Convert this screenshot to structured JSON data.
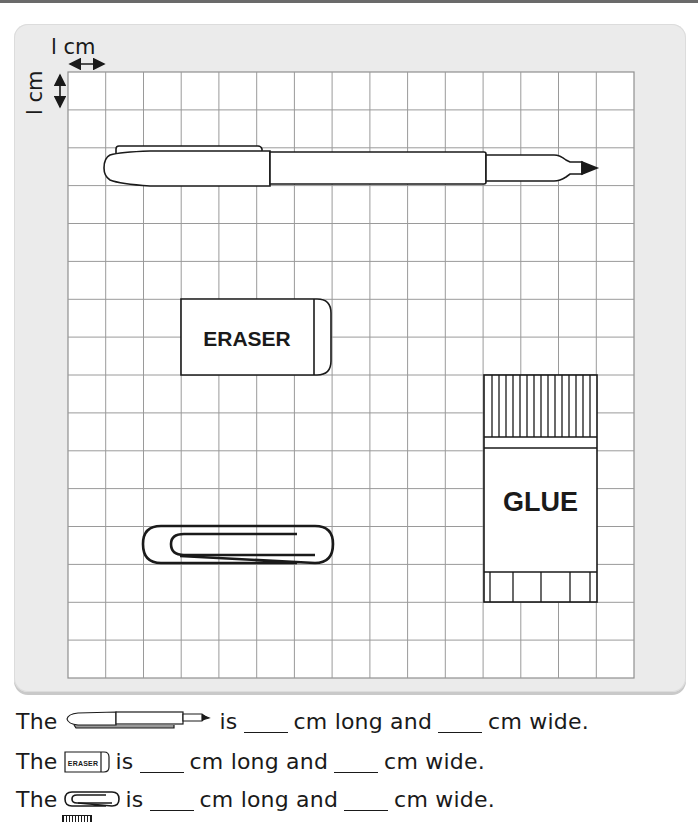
{
  "worksheet": {
    "scale_labels": {
      "horizontal": "l cm",
      "vertical": "l cm"
    },
    "grid": {
      "columns": 15,
      "rows": 16,
      "cell_size_cm": 1,
      "line_color": "#9a9a9a"
    },
    "objects": [
      {
        "name": "pen",
        "label": ""
      },
      {
        "name": "eraser",
        "label": "ERASER"
      },
      {
        "name": "glue",
        "label": "GLUE"
      },
      {
        "name": "paperclip",
        "label": ""
      }
    ],
    "questions": [
      {
        "prefix": "The",
        "object_icon": "pen-icon",
        "is": "is",
        "blank1": "",
        "unit1": "cm long and",
        "blank2": "",
        "unit2": "cm wide."
      },
      {
        "prefix": "The",
        "object_icon": "eraser-icon",
        "is": "is",
        "blank1": "",
        "unit1": "cm long and",
        "blank2": "",
        "unit2": "cm wide."
      },
      {
        "prefix": "The",
        "object_icon": "paperclip-icon",
        "is": "is",
        "blank1": "",
        "unit1": "cm long and",
        "blank2": "",
        "unit2": "cm wide."
      }
    ],
    "eraser_icon_text": "ERASER",
    "colors": {
      "panel": "#ebebeb",
      "ink": "#1a1a1a",
      "grid": "#9a9a9a"
    }
  }
}
